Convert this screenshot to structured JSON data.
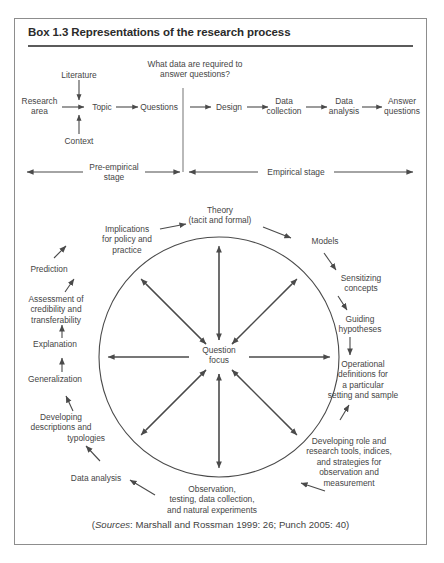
{
  "box": {
    "title": "Box 1.3  Representations of the research process",
    "border_color": "#8d8d8d",
    "rule_color": "#5b5b5b"
  },
  "diagram_top": {
    "question_prompt_line1": "What data are required to",
    "question_prompt_line2": "answer questions?",
    "nodes": {
      "literature": "Literature",
      "context": "Context",
      "research_area_line1": "Research",
      "research_area_line2": "area",
      "topic": "Topic",
      "questions": "Questions",
      "design": "Design",
      "data_collection_line1": "Data",
      "data_collection_line2": "collection",
      "data_analysis_line1": "Data",
      "data_analysis_line2": "analysis",
      "answer_questions_line1": "Answer",
      "answer_questions_line2": "questions"
    },
    "stages": {
      "pre_empirical_line1": "Pre-empirical",
      "pre_empirical_line2": "stage",
      "empirical": "Empirical stage"
    }
  },
  "diagram_circle": {
    "center_line1": "Question",
    "center_line2": "focus",
    "outer_labels": {
      "theory_line1": "Theory",
      "theory_line2": "(tacit and formal)",
      "models": "Models",
      "sensitizing_line1": "Sensitizing",
      "sensitizing_line2": "concepts",
      "guiding_line1": "Guiding",
      "guiding_line2": "hypotheses",
      "operational_line1": "Operational",
      "operational_line2": "definitions for",
      "operational_line3": "a particular",
      "operational_line4": "setting and sample",
      "developing_role_line1": "Developing role and",
      "developing_role_line2": "research tools, indices,",
      "developing_role_line3": "and strategies for",
      "developing_role_line4": "observation and",
      "developing_role_line5": "measurement",
      "observation_line1": "Observation,",
      "observation_line2": "testing, data collection,",
      "observation_line3": "and natural experiments",
      "data_analysis": "Data analysis",
      "developing_desc_line1": "Developing",
      "developing_desc_line2": "descriptions and",
      "developing_desc_line3": "typologies",
      "generalization": "Generalization",
      "explanation": "Explanation",
      "assessment_line1": "Assessment of",
      "assessment_line2": "credibility and",
      "assessment_line3": "transferability",
      "prediction": "Prediction",
      "implications_line1": "Implications",
      "implications_line2": "for policy and",
      "implications_line3": "practice"
    }
  },
  "sources": {
    "open_paren": "(",
    "label": "Sources",
    "text": ": Marshall and Rossman 1999: 26; Punch 2005: 40)"
  }
}
